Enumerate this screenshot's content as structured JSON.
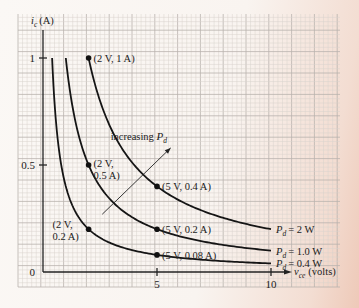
{
  "chart_data": {
    "type": "line",
    "title": "",
    "xlabel": "v_ce (volts)",
    "ylabel": "i_c (A)",
    "xlabel_main": "v",
    "xlabel_sub": "ce",
    "xlabel_unit": "(volts)",
    "ylabel_main": "i",
    "ylabel_sub": "c",
    "ylabel_unit": "(A)",
    "xlim": [
      0,
      12
    ],
    "ylim": [
      0,
      1.1
    ],
    "grid": true,
    "x_ticks": [
      {
        "value": 5,
        "label": "5"
      },
      {
        "value": 10,
        "label": "10"
      }
    ],
    "y_ticks": [
      {
        "value": 0,
        "label": "0"
      },
      {
        "value": 0.5,
        "label": "0.5"
      },
      {
        "value": 1,
        "label": "1"
      }
    ],
    "series": [
      {
        "name": "P_d = 2 W",
        "power": 2.0,
        "label_main": "P",
        "label_sub": "d",
        "label_value": "= 2 W",
        "x_range": [
          2,
          10
        ]
      },
      {
        "name": "P_d = 1.0 W",
        "power": 1.0,
        "label_main": "P",
        "label_sub": "d",
        "label_value": "= 1.0 W",
        "x_range": [
          1,
          10
        ]
      },
      {
        "name": "P_d = 0.4 W",
        "power": 0.4,
        "label_main": "P",
        "label_sub": "d",
        "label_value": "= 0.4 W",
        "x_range": [
          0.4,
          10
        ]
      }
    ],
    "points": [
      {
        "x": 2,
        "y": 1.0,
        "label": "(2 V, 1 A)",
        "label_pos": "right"
      },
      {
        "x": 2,
        "y": 0.5,
        "label": [
          "(2 V,",
          "0.5 A)"
        ],
        "label_pos": "right"
      },
      {
        "x": 2,
        "y": 0.2,
        "label": [
          "(2 V,",
          "0.2 A)"
        ],
        "label_pos": "left"
      },
      {
        "x": 5,
        "y": 0.4,
        "label": "(5 V, 0.4 A)",
        "label_pos": "right"
      },
      {
        "x": 5,
        "y": 0.2,
        "label": "(5 V, 0.2 A)",
        "label_pos": "right"
      },
      {
        "x": 5,
        "y": 0.08,
        "label": "(5 V, 0.08 A)",
        "label_pos": "right"
      }
    ],
    "annotations": [
      {
        "text": "increasing",
        "symbol_main": "P",
        "symbol_sub": "d",
        "type": "arrow",
        "from": [
          2.6,
          0.27
        ],
        "to": [
          5.6,
          0.58
        ]
      }
    ]
  }
}
